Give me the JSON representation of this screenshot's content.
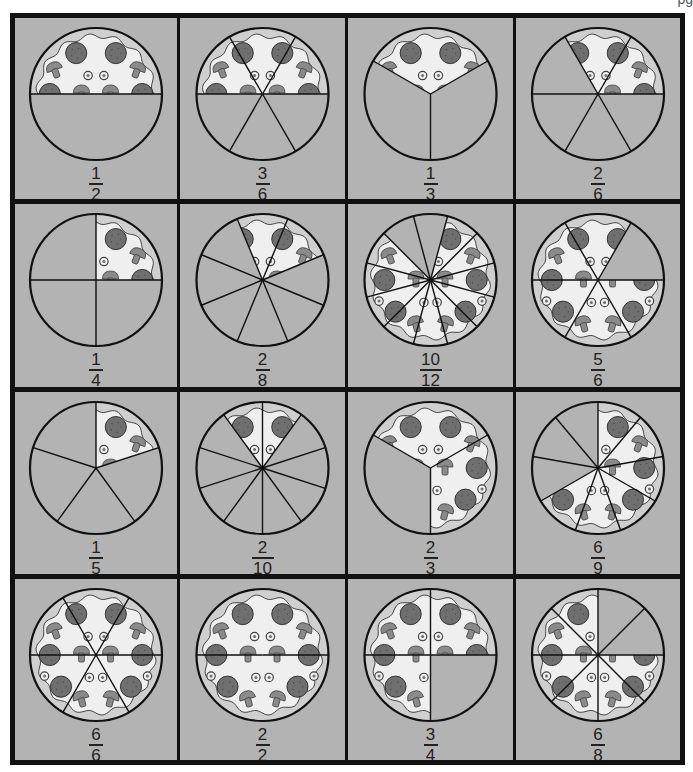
{
  "page": {
    "corner_label": "pg"
  },
  "colors": {
    "cell_bg": "#b3b3b3",
    "grid_line": "#111111",
    "outline": "#111111",
    "cheese": "#efefef",
    "crust": "#cfcfcf",
    "pepperoni": "#6f6f6f",
    "mushroom": "#8a8a8a",
    "empty_slice": "#b3b3b3"
  },
  "grid": {
    "rows": 4,
    "cols": 4
  },
  "pizzas": [
    {
      "numerator": "1",
      "denominator": "2",
      "slices": 2,
      "start_deg": 0,
      "filled": [
        0
      ]
    },
    {
      "numerator": "3",
      "denominator": "6",
      "slices": 6,
      "start_deg": 0,
      "filled": [
        0,
        1,
        2
      ]
    },
    {
      "numerator": "1",
      "denominator": "3",
      "slices": 3,
      "start_deg": 30,
      "filled": [
        0
      ]
    },
    {
      "numerator": "2",
      "denominator": "6",
      "slices": 6,
      "start_deg": 0,
      "filled": [
        0,
        1
      ]
    },
    {
      "numerator": "1",
      "denominator": "4",
      "slices": 4,
      "start_deg": 0,
      "filled": [
        0
      ]
    },
    {
      "numerator": "2",
      "denominator": "8",
      "slices": 8,
      "start_deg": 22.5,
      "filled": [
        0,
        1
      ]
    },
    {
      "numerator": "10",
      "denominator": "12",
      "slices": 12,
      "start_deg": 15,
      "filled": [
        0,
        1,
        4,
        5,
        6,
        7,
        8,
        9,
        10,
        11
      ]
    },
    {
      "numerator": "5",
      "denominator": "6",
      "slices": 6,
      "start_deg": 0,
      "filled": [
        1,
        2,
        3,
        4,
        5
      ]
    },
    {
      "numerator": "1",
      "denominator": "5",
      "slices": 5,
      "start_deg": 18,
      "filled": [
        0
      ]
    },
    {
      "numerator": "2",
      "denominator": "10",
      "slices": 10,
      "start_deg": 18,
      "filled": [
        1,
        2
      ]
    },
    {
      "numerator": "2",
      "denominator": "3",
      "slices": 3,
      "start_deg": 30,
      "filled": [
        0,
        2
      ]
    },
    {
      "numerator": "6",
      "denominator": "9",
      "slices": 9,
      "start_deg": 90,
      "filled": [
        3,
        4,
        5,
        6,
        7,
        8
      ]
    },
    {
      "numerator": "6",
      "denominator": "6",
      "slices": 6,
      "start_deg": 0,
      "filled": [
        0,
        1,
        2,
        3,
        4,
        5
      ]
    },
    {
      "numerator": "2",
      "denominator": "2",
      "slices": 2,
      "start_deg": 0,
      "filled": [
        0,
        1
      ]
    },
    {
      "numerator": "3",
      "denominator": "4",
      "slices": 4,
      "start_deg": 0,
      "filled": [
        0,
        1,
        2
      ]
    },
    {
      "numerator": "6",
      "denominator": "8",
      "slices": 8,
      "start_deg": 45,
      "filled": [
        1,
        2,
        3,
        4,
        5,
        6
      ]
    }
  ]
}
